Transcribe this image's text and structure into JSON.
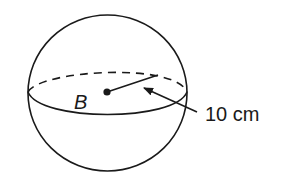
{
  "diagram": {
    "shape": "sphere",
    "center_label": "B",
    "radius_label": "10 cm",
    "colors": {
      "stroke": "#1a1a1a",
      "background": "#ffffff"
    }
  }
}
